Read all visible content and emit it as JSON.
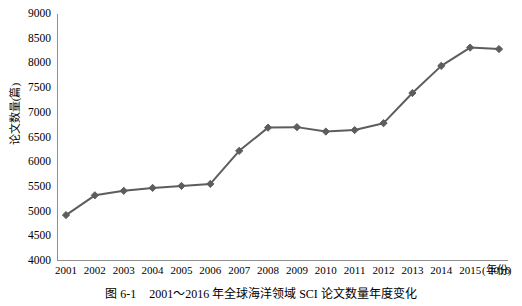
{
  "figure": {
    "caption_number": "图 6-1",
    "caption_text": "2001～2016 年全球海洋领域 SCI 论文数量年度变化"
  },
  "axes": {
    "y_title": "论文数量(篇)",
    "x_unit_label": "(年份)",
    "y_ticks": [
      "9000",
      "8500",
      "8000",
      "7500",
      "7000",
      "6500",
      "6000",
      "5500",
      "5000",
      "4500",
      "4000"
    ],
    "x_ticks": [
      "2001",
      "2002",
      "2003",
      "2004",
      "2005",
      "2006",
      "2007",
      "2008",
      "2009",
      "2010",
      "2011",
      "2012",
      "2013",
      "2014",
      "2015",
      "2016"
    ]
  },
  "style": {
    "series_color": "#5d5d5d",
    "axis_color": "#8f8f8f",
    "text_color": "#000000",
    "background": "#ffffff"
  },
  "chart_data": {
    "type": "line",
    "title": "2001～2016 年全球海洋领域 SCI 论文数量年度变化",
    "xlabel": "(年份)",
    "ylabel": "论文数量(篇)",
    "xlim": [
      2001,
      2016
    ],
    "ylim": [
      4000,
      9000
    ],
    "ytick_step": 500,
    "grid": false,
    "legend": "none",
    "marker": "diamond",
    "categories": [
      "2001",
      "2002",
      "2003",
      "2004",
      "2005",
      "2006",
      "2007",
      "2008",
      "2009",
      "2010",
      "2011",
      "2012",
      "2013",
      "2014",
      "2015",
      "2016"
    ],
    "x": [
      2001,
      2002,
      2003,
      2004,
      2005,
      2006,
      2007,
      2008,
      2009,
      2010,
      2011,
      2012,
      2013,
      2014,
      2015,
      2016
    ],
    "values": [
      4930,
      5330,
      5420,
      5480,
      5520,
      5560,
      6230,
      6700,
      6710,
      6620,
      6650,
      6790,
      7400,
      7950,
      8320,
      8290
    ],
    "series": [
      {
        "name": "全球海洋领域 SCI 论文数量",
        "values": [
          4930,
          5330,
          5420,
          5480,
          5520,
          5560,
          6230,
          6700,
          6710,
          6620,
          6650,
          6790,
          7400,
          7950,
          8320,
          8290
        ]
      }
    ]
  }
}
